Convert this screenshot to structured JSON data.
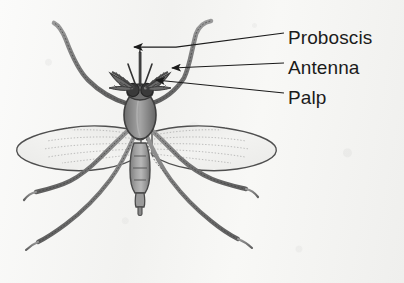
{
  "figure": {
    "view": "dorsal",
    "background_color": "#f7f7f5",
    "ink_color": "#1b1b1b",
    "body_fill": "#8a8a8a",
    "body_shade": "#6a6a6a",
    "body_highlight": "#b4b4b4",
    "wing_fill": "#efefee",
    "eye_color": "#3a3a3a"
  },
  "labels": [
    {
      "id": "proboscis",
      "text": "Proboscis",
      "x": 288,
      "y": 28,
      "arrow_tip_x": 131,
      "arrow_tip_y": 51
    },
    {
      "id": "antenna",
      "text": "Antenna",
      "x": 288,
      "y": 58,
      "arrow_tip_x": 163,
      "arrow_tip_y": 68
    },
    {
      "id": "palp",
      "text": "Palp",
      "x": 288,
      "y": 88,
      "arrow_tip_x": 150,
      "arrow_tip_y": 82
    }
  ],
  "anatomy": {
    "parts": [
      "proboscis",
      "antenna",
      "palp",
      "compound-eye",
      "head",
      "thorax",
      "abdomen",
      "wing-left",
      "wing-right",
      "leg-front-left",
      "leg-front-right",
      "leg-mid-left",
      "leg-mid-right",
      "leg-hind-left",
      "leg-hind-right"
    ],
    "wing_count": 2,
    "leg_count": 6,
    "antenna_count": 2,
    "palp_count": 2
  }
}
